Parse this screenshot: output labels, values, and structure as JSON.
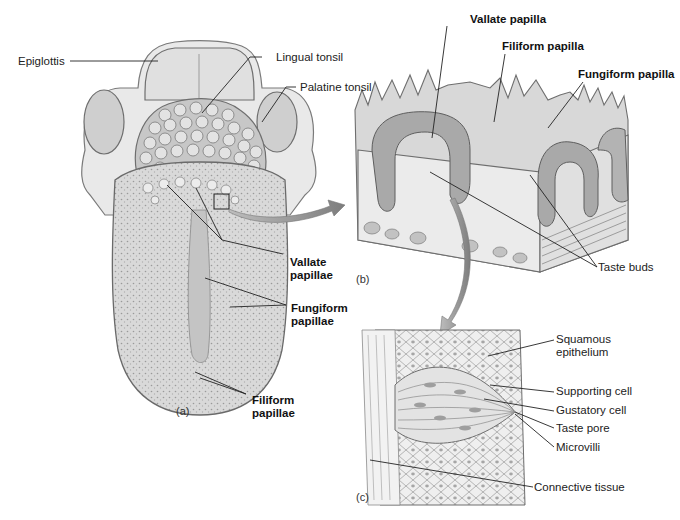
{
  "figure": {
    "panels": [
      {
        "id": "a",
        "letter": "(a)",
        "subject": "tongue-dorsal-view"
      },
      {
        "id": "b",
        "letter": "(b)",
        "subject": "papillae-block-section"
      },
      {
        "id": "c",
        "letter": "(c)",
        "subject": "taste-bud-detail"
      }
    ],
    "labels_a": {
      "epiglottis": "Epiglottis",
      "lingual_tonsil": "Lingual tonsil",
      "palatine_tonsil": "Palatine tonsil",
      "vallate_papillae_1": "Vallate",
      "vallate_papillae_2": "papillae",
      "fungiform_papillae_1": "Fungiform",
      "fungiform_papillae_2": "papillae",
      "filiform_papillae_1": "Filiform",
      "filiform_papillae_2": "papillae"
    },
    "labels_b": {
      "vallate_papilla": "Vallate papilla",
      "filiform_papilla": "Filiform papilla",
      "fungiform_papilla": "Fungiform papilla",
      "taste_buds": "Taste buds"
    },
    "labels_c": {
      "squamous_1": "Squamous",
      "squamous_2": "epithelium",
      "supporting_cell": "Supporting cell",
      "gustatory_cell": "Gustatory cell",
      "taste_pore": "Taste pore",
      "microvilli": "Microvilli",
      "connective_tissue": "Connective tissue"
    },
    "colors": {
      "tissue_light": "#e6e6e6",
      "tissue_mid": "#bdbdbd",
      "tissue_dark": "#8a8a8a",
      "leader_line": "#222222",
      "arrow": "#8c8c8c"
    }
  }
}
